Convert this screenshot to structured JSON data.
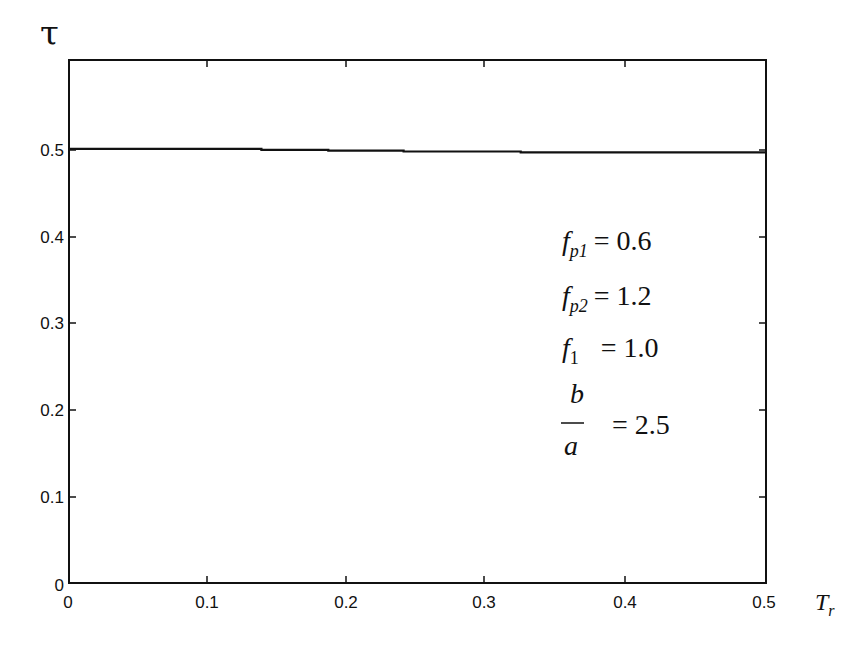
{
  "chart_data": {
    "type": "line",
    "title": "",
    "xlabel": "T_r",
    "ylabel": "τ",
    "xlim": [
      0,
      0.5
    ],
    "ylim": [
      0,
      0.6
    ],
    "grid": false,
    "legend": null,
    "x_ticks": [
      "0",
      "0.1",
      "0.2",
      "0.3",
      "0.4",
      "0.5"
    ],
    "y_ticks": [
      "0",
      "0.1",
      "0.2",
      "0.3",
      "0.4",
      "0.5"
    ],
    "series": [
      {
        "name": "τ(T_r)",
        "color": "#111111",
        "x": [
          0.0,
          0.138,
          0.138,
          0.186,
          0.186,
          0.24,
          0.24,
          0.324,
          0.324,
          0.5
        ],
        "y": [
          0.498,
          0.498,
          0.497,
          0.497,
          0.496,
          0.496,
          0.495,
          0.495,
          0.494,
          0.494
        ]
      }
    ],
    "annotations": [
      {
        "symbol": "f",
        "subscript": "p1",
        "text": "= 0.6",
        "value": 0.6
      },
      {
        "symbol": "f",
        "subscript": "p2",
        "text": "= 1.2",
        "value": 1.2
      },
      {
        "symbol": "f",
        "subscript": "1",
        "text": "= 1.0",
        "value": 1.0
      },
      {
        "symbol": "b/a",
        "numerator": "b",
        "denominator": "a",
        "text": "= 2.5",
        "value": 2.5
      }
    ]
  },
  "labels": {
    "y_axis": "τ",
    "x_axis_main": "T",
    "x_axis_sub": "r",
    "y_tick_0": "0",
    "y_tick_1": "0.1",
    "y_tick_2": "0.2",
    "y_tick_3": "0.3",
    "y_tick_4": "0.4",
    "y_tick_5": "0.5",
    "x_tick_0": "0",
    "x_tick_1": "0.1",
    "x_tick_2": "0.2",
    "x_tick_3": "0.3",
    "x_tick_4": "0.4",
    "x_tick_5": "0.5",
    "ann_f": "f",
    "ann_fp1_sub": "p1",
    "ann_fp1_val": "= 0.6",
    "ann_fp2_sub": "p2",
    "ann_fp2_val": "= 1.2",
    "ann_f1_sub": "1",
    "ann_f1_val": "= 1.0",
    "ann_b": "b",
    "ann_a": "a",
    "ann_ba_val": "= 2.5"
  }
}
